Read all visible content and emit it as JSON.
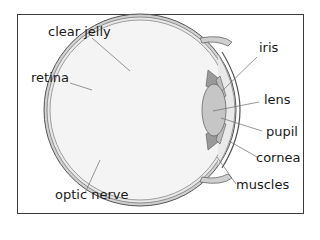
{
  "diagram": {
    "labels": {
      "clear_jelly": "clear jelly",
      "retina": "retina",
      "optic_nerve": "optic nerve",
      "iris": "iris",
      "lens": "lens",
      "pupil": "pupil",
      "cornea": "cornea",
      "muscles": "muscles"
    },
    "colors": {
      "frame": "#3a3a3a",
      "outline": "#555555",
      "fill_light": "#f2f2f2",
      "fill_mid": "#c8c8c8",
      "fill_dark": "#9a9a9a",
      "leader_line": "#6a6a6a",
      "text": "#1a1a1a"
    }
  }
}
